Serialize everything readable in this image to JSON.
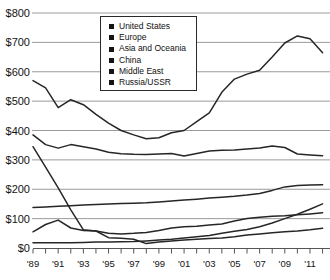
{
  "chart_data": {
    "type": "line",
    "title": "",
    "xlabel": "",
    "ylabel": "",
    "ylim": [
      0,
      800
    ],
    "grid": "horizontal",
    "legend_position": "inside-top-center",
    "x": [
      1989,
      1990,
      1991,
      1992,
      1993,
      1994,
      1995,
      1996,
      1997,
      1998,
      1999,
      2000,
      2001,
      2002,
      2003,
      2004,
      2005,
      2006,
      2007,
      2008,
      2009,
      2010,
      2011,
      2012
    ],
    "x_ticks": [
      {
        "year": 1989,
        "label": "'89"
      },
      {
        "year": 1991,
        "label": "'91"
      },
      {
        "year": 1993,
        "label": "'93"
      },
      {
        "year": 1995,
        "label": "'95"
      },
      {
        "year": 1997,
        "label": "'97"
      },
      {
        "year": 1999,
        "label": "'99"
      },
      {
        "year": 2001,
        "label": "'01"
      },
      {
        "year": 2003,
        "label": "'03"
      },
      {
        "year": 2005,
        "label": "'05"
      },
      {
        "year": 2007,
        "label": "'07"
      },
      {
        "year": 2009,
        "label": "'09"
      },
      {
        "year": 2011,
        "label": "'11"
      }
    ],
    "y_ticks": [
      {
        "value": 800,
        "label": "$800"
      },
      {
        "value": 700,
        "label": "$700"
      },
      {
        "value": 600,
        "label": "$600"
      },
      {
        "value": 500,
        "label": "$500"
      },
      {
        "value": 400,
        "label": "$400"
      },
      {
        "value": 300,
        "label": "$300"
      },
      {
        "value": 200,
        "label": "$200"
      },
      {
        "value": 100,
        "label": "$100"
      },
      {
        "value": 0,
        "label": "$0"
      }
    ],
    "series": [
      {
        "name": "United States",
        "values": [
          570,
          545,
          478,
          505,
          488,
          455,
          425,
          400,
          385,
          372,
          375,
          392,
          400,
          430,
          460,
          530,
          575,
          592,
          605,
          650,
          698,
          722,
          712,
          665
        ]
      },
      {
        "name": "Europe",
        "values": [
          385,
          352,
          340,
          352,
          345,
          337,
          326,
          321,
          319,
          318,
          320,
          322,
          313,
          322,
          330,
          333,
          334,
          337,
          340,
          347,
          342,
          320,
          317,
          314
        ]
      },
      {
        "name": "Asia and Oceania",
        "values": [
          138,
          140,
          142,
          144,
          146,
          148,
          150,
          151,
          152,
          154,
          157,
          160,
          163,
          166,
          170,
          173,
          176,
          180,
          186,
          196,
          208,
          213,
          214,
          215
        ]
      },
      {
        "name": "China",
        "values": [
          18,
          18,
          18,
          18,
          19,
          20,
          20,
          21,
          22,
          24,
          27,
          30,
          34,
          38,
          43,
          50,
          57,
          63,
          72,
          85,
          100,
          115,
          132,
          150
        ]
      },
      {
        "name": "Middle East",
        "values": [
          55,
          80,
          95,
          68,
          60,
          58,
          50,
          48,
          50,
          53,
          60,
          68,
          72,
          74,
          78,
          82,
          92,
          100,
          105,
          108,
          110,
          113,
          116,
          120
        ]
      },
      {
        "name": "Russia/USSR",
        "values": [
          345,
          275,
          205,
          130,
          62,
          58,
          35,
          33,
          30,
          15,
          20,
          24,
          27,
          30,
          32,
          34,
          38,
          44,
          48,
          52,
          55,
          58,
          62,
          67
        ]
      }
    ],
    "colors": {
      "line": "#262626",
      "grid": "#8f8f8f",
      "axis": "#555555",
      "text": "#141414",
      "legend_marker": "#141414",
      "background": "#ffffff"
    }
  }
}
